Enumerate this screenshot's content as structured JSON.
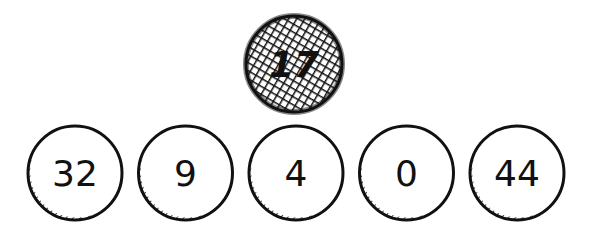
{
  "diagram": {
    "title": "",
    "root": {
      "label": "17",
      "style": "crosshatched"
    },
    "children": [
      {
        "label": "32",
        "style": "plain"
      },
      {
        "label": "9",
        "style": "plain"
      },
      {
        "label": "4",
        "style": "plain"
      },
      {
        "label": "0",
        "style": "plain"
      },
      {
        "label": "44",
        "style": "plain"
      }
    ]
  }
}
